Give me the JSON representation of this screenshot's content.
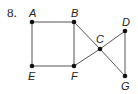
{
  "problem_number": "8.",
  "graph": {
    "vertices": [
      {
        "id": "A",
        "label": "A",
        "x": 32,
        "y": 22,
        "lx": 29,
        "ly": 17
      },
      {
        "id": "B",
        "label": "B",
        "x": 74,
        "y": 22,
        "lx": 71,
        "ly": 17
      },
      {
        "id": "C",
        "label": "C",
        "x": 100,
        "y": 49,
        "lx": 96,
        "ly": 43
      },
      {
        "id": "D",
        "label": "D",
        "x": 125,
        "y": 31,
        "lx": 122,
        "ly": 26
      },
      {
        "id": "E",
        "label": "E",
        "x": 32,
        "y": 66,
        "lx": 28,
        "ly": 80
      },
      {
        "id": "F",
        "label": "F",
        "x": 74,
        "y": 66,
        "lx": 71,
        "ly": 80
      },
      {
        "id": "G",
        "label": "G",
        "x": 125,
        "y": 76,
        "lx": 121,
        "ly": 90
      }
    ],
    "edges": [
      [
        "A",
        "B"
      ],
      [
        "A",
        "E"
      ],
      [
        "B",
        "F"
      ],
      [
        "E",
        "F"
      ],
      [
        "B",
        "C"
      ],
      [
        "F",
        "C"
      ],
      [
        "C",
        "D"
      ],
      [
        "C",
        "G"
      ],
      [
        "D",
        "G"
      ]
    ],
    "colors": {
      "edge": "#555555",
      "vertex": "#111111",
      "label": "#222222"
    }
  }
}
